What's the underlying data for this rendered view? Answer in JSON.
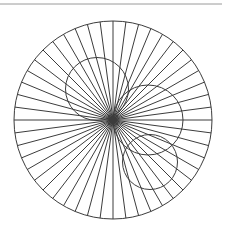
{
  "canvas": {
    "width": 227,
    "height": 234,
    "background": "#ffffff"
  },
  "top_rule": {
    "label": "horizontal rule",
    "x1": 0,
    "x2": 222,
    "y": 4,
    "stroke": "#9a9a9a",
    "stroke_width": 1
  },
  "figure": {
    "title": "",
    "stroke": "#3c3c3c",
    "stroke_width": 1,
    "fill": "none"
  },
  "chart_data": {
    "type": "diagram",
    "title": "",
    "subtitle": "",
    "xlabel": "",
    "ylabel": "",
    "outer_circle": {
      "name": "outer-circle",
      "cx": 113,
      "cy": 120,
      "r": 99
    },
    "spokes": {
      "name": "radial-spokes",
      "count": 48,
      "angle_step_deg": 7.5,
      "start_angle_deg": 0,
      "cx": 113,
      "cy": 120,
      "r": 99
    },
    "inner_circles": [
      {
        "name": "inner-circle-upper-left",
        "cx": 97,
        "cy": 89,
        "r": 31.5
      },
      {
        "name": "inner-circle-right",
        "cx": 148,
        "cy": 120,
        "r": 35
      },
      {
        "name": "inner-circle-lower-right",
        "cx": 150,
        "cy": 162,
        "r": 27.5
      }
    ],
    "axis_lines": [
      {
        "name": "horizontal-diameter",
        "x1": 14,
        "y1": 120,
        "x2": 212,
        "y2": 120
      },
      {
        "name": "vertical-diameter",
        "x1": 113,
        "y1": 21,
        "x2": 113,
        "y2": 219
      }
    ],
    "grid": false,
    "legend": null
  }
}
